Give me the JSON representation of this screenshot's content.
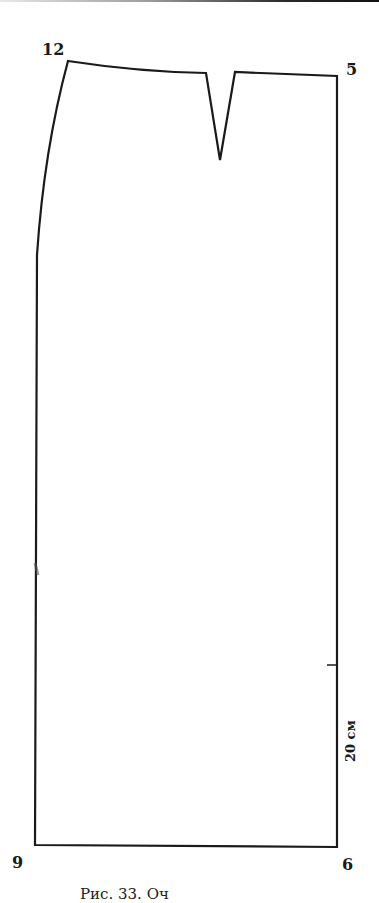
{
  "figure": {
    "type": "skirt pattern draft (back panel)",
    "points": [
      {
        "id": "12",
        "label": "12",
        "x": 68,
        "y": 61
      },
      {
        "id": "5",
        "label": "5",
        "x": 337,
        "y": 76
      },
      {
        "id": "9",
        "label": "9",
        "x": 35,
        "y": 845
      },
      {
        "id": "6",
        "label": "6",
        "x": 337,
        "y": 847
      }
    ],
    "dart": {
      "left": [
        206,
        73
      ],
      "tip": [
        220,
        160
      ],
      "right": [
        235,
        72
      ]
    },
    "scale": {
      "label": "20 см",
      "tick_y": 665
    },
    "caption": "Рис. 33. Оч"
  },
  "labels": {
    "p12": "12",
    "p5": "5",
    "p9": "9",
    "p6": "6",
    "scale": "20 см",
    "caption": "Рис. 33. Оч"
  },
  "colors": {
    "line": "#1a1a1a",
    "background": "#ffffff"
  }
}
